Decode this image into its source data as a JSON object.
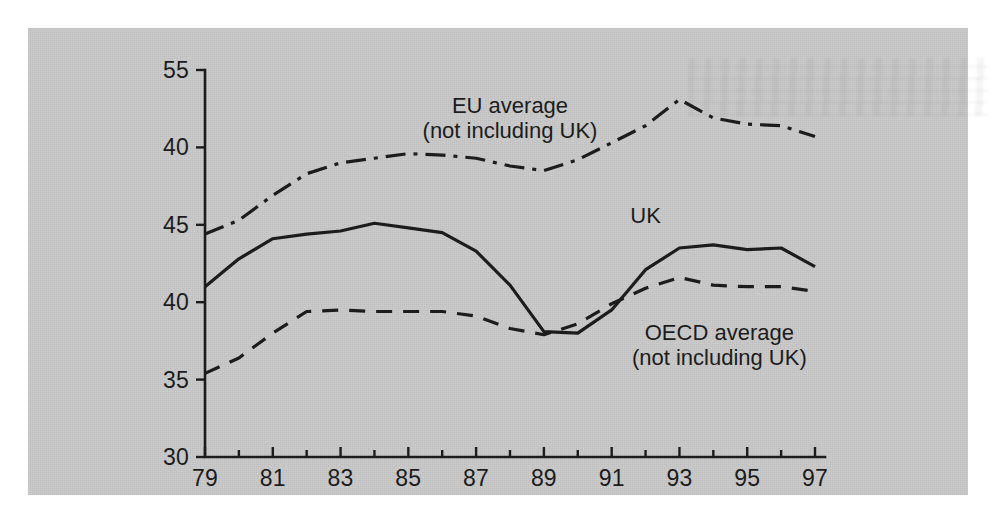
{
  "figure": {
    "panel_color": "#c9c9c9",
    "ink_color": "#1c1c1c",
    "page_color": "#ffffff"
  },
  "chart_data": {
    "type": "line",
    "title": "",
    "subtitle": "",
    "xlabel": "",
    "ylabel": "",
    "grid": false,
    "legend_position": "inline-annotations",
    "x": [
      79,
      80,
      81,
      82,
      83,
      84,
      85,
      86,
      87,
      88,
      89,
      90,
      91,
      92,
      93,
      94,
      95,
      96,
      97
    ],
    "x_tick_labels": [
      "79",
      "81",
      "83",
      "85",
      "87",
      "89",
      "91",
      "93",
      "95",
      "97"
    ],
    "x_tick_values": [
      79,
      81,
      83,
      85,
      87,
      89,
      91,
      93,
      95,
      97
    ],
    "xlim": [
      79,
      97
    ],
    "y_tick_labels": [
      "55",
      "40",
      "45",
      "40",
      "35",
      "30"
    ],
    "y_tick_values": [
      55,
      50,
      45,
      40,
      35,
      30
    ],
    "ylim": [
      30,
      55
    ],
    "series": [
      {
        "name": "EU average",
        "name_line2": "(not including UK)",
        "style": "dash-dot",
        "values": [
          44.4,
          45.3,
          46.9,
          48.3,
          49.0,
          49.3,
          49.6,
          49.5,
          49.3,
          48.8,
          48.5,
          49.2,
          50.3,
          51.4,
          53.1,
          51.9,
          51.5,
          51.4,
          50.7
        ]
      },
      {
        "name": "UK",
        "name_line2": "",
        "style": "solid",
        "values": [
          41.0,
          42.8,
          44.1,
          44.4,
          44.6,
          45.1,
          44.8,
          44.5,
          43.3,
          41.1,
          38.1,
          38.0,
          39.5,
          42.1,
          43.5,
          43.7,
          43.4,
          43.5,
          42.3
        ]
      },
      {
        "name": "OECD average",
        "name_line2": "(not including UK)",
        "style": "dashed",
        "values": [
          35.4,
          36.4,
          38.0,
          39.4,
          39.5,
          39.4,
          39.4,
          39.4,
          39.1,
          38.3,
          37.9,
          38.6,
          39.9,
          40.9,
          41.6,
          41.1,
          41.0,
          41.0,
          40.7
        ]
      }
    ]
  },
  "annotations": [
    {
      "id": "eu-label",
      "line1": "EU average",
      "line2": "(not including UK)"
    },
    {
      "id": "uk-label",
      "line1": "UK",
      "line2": ""
    },
    {
      "id": "oecd-label",
      "line1": "OECD average",
      "line2": "(not including UK)"
    }
  ]
}
